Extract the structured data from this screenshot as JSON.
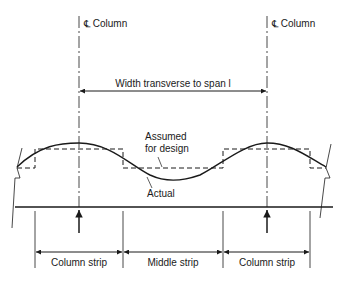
{
  "diagram": {
    "column_label_left": "℄ Column",
    "column_label_right": "℄ Column",
    "width_label": "Width transverse to span l",
    "assumed_label_line1": "Assumed",
    "assumed_label_line2": "for design",
    "actual_label": "Actual",
    "strips": [
      {
        "label": "Column strip"
      },
      {
        "label": "Middle strip"
      },
      {
        "label": "Column strip"
      }
    ],
    "colors": {
      "ink": "#1a1a1a",
      "background": "#ffffff"
    }
  }
}
